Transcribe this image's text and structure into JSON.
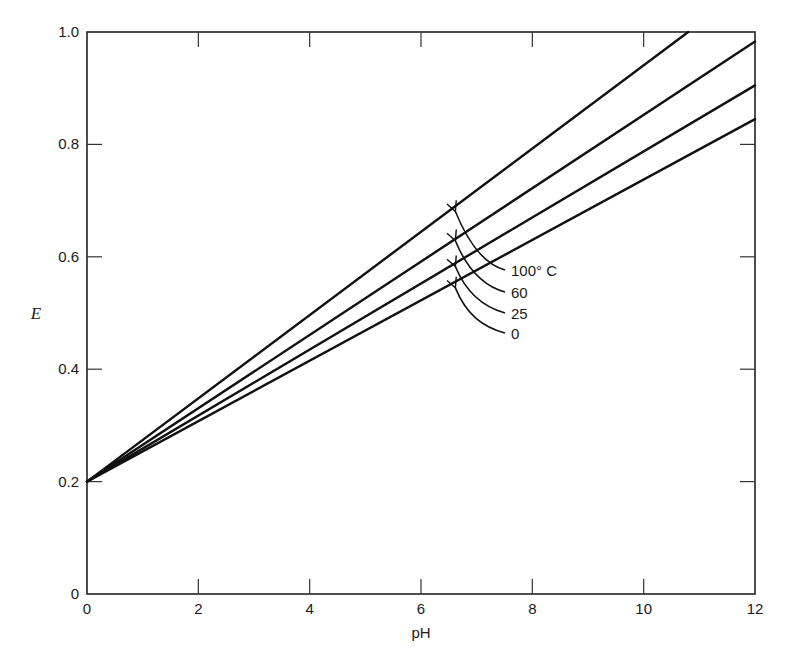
{
  "chart_data": {
    "type": "line",
    "title": "",
    "xlabel": "pH",
    "ylabel": "E",
    "xlim": [
      0,
      12
    ],
    "ylim": [
      0,
      1.0
    ],
    "xticks": [
      0,
      2,
      4,
      6,
      8,
      10,
      12
    ],
    "xtick_labels": [
      "0",
      "2",
      "4",
      "6",
      "8",
      "10",
      "12"
    ],
    "yticks": [
      0,
      0.2,
      0.4,
      0.6,
      0.8,
      1.0
    ],
    "ytick_labels": [
      "0",
      "0.2",
      "0.4",
      "0.6",
      "0.8",
      "1.0"
    ],
    "grid": false,
    "legend": "none (inline arrow annotations)",
    "series": [
      {
        "name": "100° C",
        "x": [
          0,
          10.8
        ],
        "y": [
          0.2,
          1.0
        ]
      },
      {
        "name": "60",
        "x": [
          0,
          12
        ],
        "y": [
          0.2,
          0.983
        ]
      },
      {
        "name": "25",
        "x": [
          0,
          12
        ],
        "y": [
          0.2,
          0.905
        ]
      },
      {
        "name": "0",
        "x": [
          0,
          12
        ],
        "y": [
          0.2,
          0.845
        ]
      }
    ],
    "annotations": [
      {
        "text": "100° C",
        "arrow_to": {
          "x": 6.6,
          "y": 0.686
        }
      },
      {
        "text": "60",
        "arrow_to": {
          "x": 6.6,
          "y": 0.634
        }
      },
      {
        "text": "25",
        "arrow_to": {
          "x": 6.6,
          "y": 0.588
        }
      },
      {
        "text": "0",
        "arrow_to": {
          "x": 6.6,
          "y": 0.55
        }
      }
    ]
  },
  "colors": {
    "line": "#111111",
    "axis": "#222222",
    "background": "#ffffff"
  }
}
